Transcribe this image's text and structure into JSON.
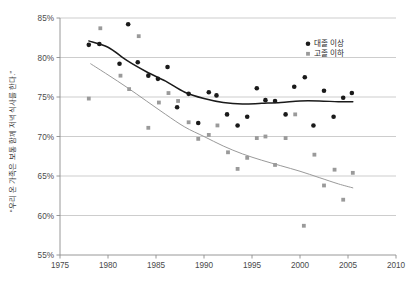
{
  "chart_data": {
    "type": "scatter",
    "title": "",
    "subtitle": "",
    "xlabel": "",
    "ylabel": "“우리 온 가족은 보통 함께 저녁식사를 한다.”",
    "xlim": [
      1975,
      2010
    ],
    "ylim": [
      55,
      85
    ],
    "xticks": [
      1975,
      1980,
      1985,
      1990,
      1995,
      2000,
      2005,
      2010
    ],
    "xtick_labels": [
      "1975",
      "1980",
      "1985",
      "1990",
      "1995",
      "2000",
      "2005",
      "2010"
    ],
    "yticks": [
      55,
      60,
      65,
      70,
      75,
      80,
      85
    ],
    "ytick_labels": [
      "55%",
      "60%",
      "65%",
      "70%",
      "75%",
      "80%",
      "85%"
    ],
    "grid": "horizontal",
    "legend_position": "top-right",
    "series": [
      {
        "name": "대졸 이상",
        "marker": "circle",
        "color": "#1a1a1a",
        "points": [
          [
            1978.0,
            81.6
          ],
          [
            1979.1,
            81.7
          ],
          [
            1981.2,
            79.2
          ],
          [
            1982.1,
            84.2
          ],
          [
            1983.1,
            79.4
          ],
          [
            1984.2,
            77.7
          ],
          [
            1985.2,
            77.3
          ],
          [
            1986.2,
            78.8
          ],
          [
            1987.2,
            73.7
          ],
          [
            1988.4,
            75.4
          ],
          [
            1989.4,
            71.7
          ],
          [
            1990.5,
            75.6
          ],
          [
            1991.3,
            75.2
          ],
          [
            1992.4,
            72.8
          ],
          [
            1993.5,
            71.4
          ],
          [
            1994.5,
            72.5
          ],
          [
            1995.5,
            76.1
          ],
          [
            1996.4,
            74.6
          ],
          [
            1997.4,
            74.5
          ],
          [
            1998.5,
            72.8
          ],
          [
            1999.4,
            76.3
          ],
          [
            2000.5,
            77.5
          ],
          [
            2001.4,
            71.4
          ],
          [
            2002.5,
            75.8
          ],
          [
            2003.5,
            72.5
          ],
          [
            2004.5,
            74.9
          ],
          [
            2005.4,
            75.5
          ]
        ],
        "trend": [
          [
            1978.0,
            82.1
          ],
          [
            1980.0,
            81.3
          ],
          [
            1982.0,
            79.6
          ],
          [
            1984.0,
            78.2
          ],
          [
            1986.0,
            77.0
          ],
          [
            1988.0,
            75.6
          ],
          [
            1990.0,
            74.8
          ],
          [
            1992.0,
            74.3
          ],
          [
            1994.0,
            74.1
          ],
          [
            1996.0,
            74.2
          ],
          [
            1998.0,
            74.3
          ],
          [
            2000.0,
            74.5
          ],
          [
            2002.0,
            74.5
          ],
          [
            2004.0,
            74.4
          ],
          [
            2005.5,
            74.4
          ]
        ]
      },
      {
        "name": "고졸 이하",
        "marker": "square",
        "color": "#9a9a9a",
        "points": [
          [
            1978.0,
            74.8
          ],
          [
            1979.2,
            83.7
          ],
          [
            1981.3,
            77.7
          ],
          [
            1982.2,
            76.0
          ],
          [
            1983.2,
            82.7
          ],
          [
            1984.2,
            71.1
          ],
          [
            1985.3,
            74.3
          ],
          [
            1986.3,
            75.5
          ],
          [
            1987.3,
            74.5
          ],
          [
            1988.4,
            71.8
          ],
          [
            1989.4,
            69.7
          ],
          [
            1990.5,
            70.2
          ],
          [
            1991.4,
            71.4
          ],
          [
            1992.5,
            68.0
          ],
          [
            1993.5,
            65.9
          ],
          [
            1994.5,
            67.3
          ],
          [
            1995.5,
            69.8
          ],
          [
            1996.4,
            70.0
          ],
          [
            1997.4,
            66.4
          ],
          [
            1998.5,
            69.8
          ],
          [
            1999.5,
            72.8
          ],
          [
            2000.4,
            58.7
          ],
          [
            2001.5,
            67.7
          ],
          [
            2002.5,
            63.8
          ],
          [
            2003.6,
            65.8
          ],
          [
            2004.5,
            62.0
          ],
          [
            2005.5,
            65.4
          ]
        ],
        "trend": [
          [
            1978.2,
            79.2
          ],
          [
            1980.0,
            77.8
          ],
          [
            1982.0,
            76.2
          ],
          [
            1984.0,
            74.5
          ],
          [
            1986.0,
            72.8
          ],
          [
            1988.0,
            71.2
          ],
          [
            1990.0,
            70.0
          ],
          [
            1992.0,
            68.8
          ],
          [
            1994.0,
            67.8
          ],
          [
            1996.0,
            67.0
          ],
          [
            1998.0,
            66.3
          ],
          [
            2000.0,
            65.6
          ],
          [
            2002.0,
            64.8
          ],
          [
            2004.0,
            64.0
          ],
          [
            2005.5,
            63.5
          ]
        ]
      }
    ]
  },
  "legend": {
    "items": [
      {
        "label": "대졸 이상",
        "marker": "circle",
        "color": "#1a1a1a"
      },
      {
        "label": "고졸 이하",
        "marker": "square",
        "color": "#9a9a9a"
      }
    ]
  },
  "axis_title": {
    "y": "“우리 온 가족은 보통 함께 저녁식사를 한다.”"
  }
}
